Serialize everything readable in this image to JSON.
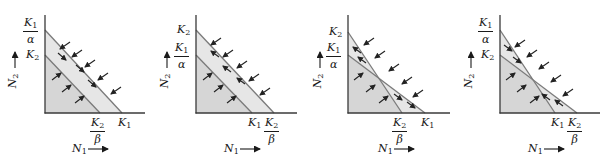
{
  "colors": {
    "axis": "#3a3a3a",
    "line": "#7a7a7a",
    "fill_outer": "#e6e6e6",
    "fill_inner": "#d6d6d6",
    "arrow": "#222222",
    "text": "#1a1a1a"
  },
  "axis_labels": {
    "x": "N",
    "x_sub": "1",
    "y": "N",
    "y_sub": "2"
  },
  "panels": [
    {
      "id": "panel-1",
      "case": "K1/alpha > K2 and K1 > K2/beta",
      "ox": 45,
      "oy": 113,
      "ytop": 15,
      "xend": 145,
      "y_intercepts": [
        {
          "kind": "frac",
          "num": "K",
          "num_sub": "1",
          "den": "α",
          "y": 30
        },
        {
          "kind": "single",
          "text": "K",
          "sub": "2",
          "y": 55
        }
      ],
      "x_intercepts": [
        {
          "kind": "frac",
          "num": "K",
          "num_sub": "2",
          "den": "β",
          "x": 100
        },
        {
          "kind": "single",
          "text": "K",
          "sub": "1",
          "x": 122
        }
      ],
      "lines": [
        [
          45,
          30,
          122,
          113
        ],
        [
          45,
          55,
          100,
          113
        ]
      ],
      "arrows": [
        [
          70,
          42,
          60,
          49
        ],
        [
          82,
          50,
          72,
          57
        ],
        [
          95,
          60,
          85,
          67
        ],
        [
          108,
          73,
          98,
          80
        ],
        [
          121,
          87,
          111,
          94
        ],
        [
          58,
          53,
          66,
          60
        ],
        [
          76,
          65,
          84,
          72
        ],
        [
          88,
          80,
          96,
          87
        ],
        [
          52,
          80,
          61,
          73
        ],
        [
          62,
          92,
          71,
          85
        ],
        [
          75,
          103,
          84,
          96
        ]
      ],
      "y_arrow_x": 15,
      "x_label_x": 72
    },
    {
      "id": "panel-2",
      "case": "K2 > K1/alpha and K2/beta > K1",
      "ox": 196,
      "oy": 113,
      "ytop": 15,
      "xend": 297,
      "y_intercepts": [
        {
          "kind": "single",
          "text": "K",
          "sub": "2",
          "y": 30
        },
        {
          "kind": "frac",
          "num": "K",
          "num_sub": "1",
          "den": "α",
          "y": 55
        }
      ],
      "x_intercepts": [
        {
          "kind": "single",
          "text": "K",
          "sub": "1",
          "x": 252
        },
        {
          "kind": "frac",
          "num": "K",
          "num_sub": "2",
          "den": "β",
          "x": 274
        }
      ],
      "lines": [
        [
          196,
          30,
          274,
          113
        ],
        [
          196,
          55,
          252,
          113
        ]
      ],
      "arrows": [
        [
          221,
          38,
          211,
          45
        ],
        [
          233,
          50,
          223,
          57
        ],
        [
          247,
          61,
          237,
          68
        ],
        [
          259,
          74,
          249,
          81
        ],
        [
          270,
          88,
          260,
          95
        ],
        [
          219,
          57,
          211,
          51
        ],
        [
          231,
          72,
          223,
          66
        ],
        [
          245,
          84,
          237,
          78
        ],
        [
          203,
          80,
          212,
          73
        ],
        [
          214,
          92,
          223,
          85
        ],
        [
          227,
          103,
          236,
          96
        ]
      ],
      "y_arrow_x": 167,
      "x_label_x": 224
    },
    {
      "id": "panel-3",
      "case": "K2 > K1/alpha and K1 > K2/beta (unstable crossing)",
      "ox": 348,
      "oy": 113,
      "ytop": 15,
      "xend": 450,
      "y_intercepts": [
        {
          "kind": "single",
          "text": "K",
          "sub": "2",
          "y": 32
        },
        {
          "kind": "frac",
          "num": "K",
          "num_sub": "1",
          "den": "α",
          "y": 55
        }
      ],
      "x_intercepts": [
        {
          "kind": "frac",
          "num": "K",
          "num_sub": "2",
          "den": "β",
          "x": 402
        },
        {
          "kind": "single",
          "text": "K",
          "sub": "1",
          "x": 425
        }
      ],
      "lines": [
        [
          348,
          32,
          402,
          113
        ],
        [
          348,
          55,
          425,
          113
        ]
      ],
      "arrows": [
        [
          374,
          38,
          364,
          45
        ],
        [
          385,
          51,
          375,
          58
        ],
        [
          399,
          64,
          389,
          71
        ],
        [
          412,
          77,
          402,
          84
        ],
        [
          423,
          90,
          413,
          97
        ],
        [
          361,
          53,
          353,
          47
        ],
        [
          366,
          63,
          358,
          57
        ],
        [
          394,
          94,
          402,
          100
        ],
        [
          407,
          102,
          415,
          108
        ],
        [
          354,
          80,
          363,
          73
        ],
        [
          366,
          92,
          375,
          85
        ],
        [
          379,
          103,
          388,
          96
        ]
      ],
      "y_arrow_x": 320,
      "x_label_x": 378
    },
    {
      "id": "panel-4",
      "case": "K1/alpha > K2 and K2/beta > K1 (stable coexistence)",
      "ox": 500,
      "oy": 113,
      "ytop": 15,
      "xend": 600,
      "y_intercepts": [
        {
          "kind": "frac",
          "num": "K",
          "num_sub": "1",
          "den": "α",
          "y": 30
        },
        {
          "kind": "single",
          "text": "K",
          "sub": "2",
          "y": 55
        }
      ],
      "x_intercepts": [
        {
          "kind": "single",
          "text": "K",
          "sub": "1",
          "x": 555
        },
        {
          "kind": "frac",
          "num": "K",
          "num_sub": "2",
          "den": "β",
          "x": 577
        }
      ],
      "lines": [
        [
          500,
          30,
          555,
          113
        ],
        [
          500,
          55,
          577,
          113
        ]
      ],
      "arrows": [
        [
          525,
          40,
          515,
          47
        ],
        [
          537,
          50,
          527,
          57
        ],
        [
          549,
          62,
          539,
          69
        ],
        [
          561,
          75,
          551,
          82
        ],
        [
          573,
          89,
          563,
          96
        ],
        [
          504,
          45,
          512,
          51
        ],
        [
          513,
          57,
          521,
          63
        ],
        [
          550,
          100,
          542,
          94
        ],
        [
          563,
          106,
          555,
          100
        ],
        [
          506,
          80,
          515,
          73
        ],
        [
          517,
          92,
          526,
          85
        ],
        [
          530,
          103,
          539,
          96
        ]
      ],
      "y_arrow_x": 471,
      "x_label_x": 528
    }
  ]
}
